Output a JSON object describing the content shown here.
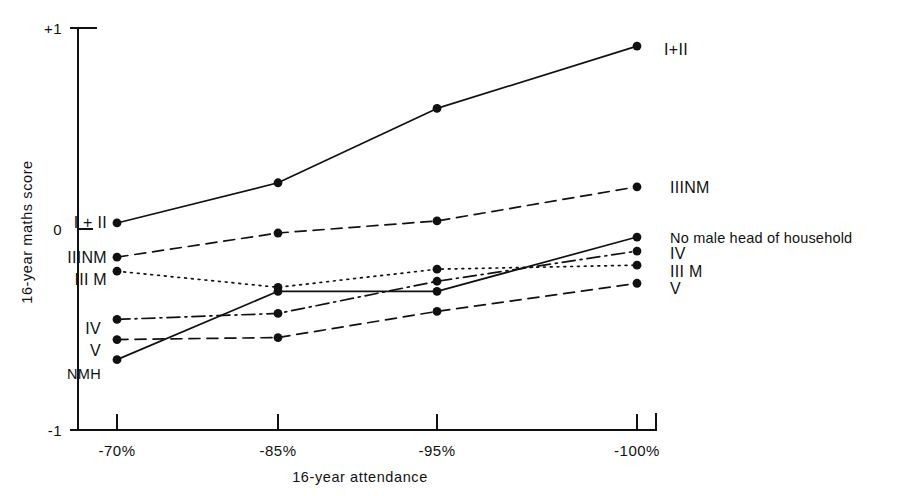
{
  "chart_data": {
    "type": "line",
    "title": "",
    "xlabel": "16-year attendance",
    "ylabel": "16-year maths score",
    "categories": [
      "-70%",
      "-85%",
      "-95%",
      "-100%"
    ],
    "xticklabels": [
      "-70%",
      "-85%",
      "-95%",
      "-100%"
    ],
    "yticklabels": [
      "+1",
      "0",
      "-1"
    ],
    "ytickvalues": [
      1,
      0,
      -1
    ],
    "ylim": [
      -1,
      1
    ],
    "grid": false,
    "legend": "inline-endpoint-labels",
    "series": [
      {
        "name": "I + II",
        "left_label": "I + II",
        "right_label": "I+II",
        "linestyle": "solid",
        "values": [
          0.03,
          0.23,
          0.6,
          0.91
        ]
      },
      {
        "name": "III NM",
        "left_label": "IIINM",
        "right_label": "IIINM",
        "linestyle": "dashed",
        "values": [
          -0.14,
          -0.02,
          0.04,
          0.21
        ]
      },
      {
        "name": "III M",
        "left_label": "III M",
        "right_label": "III M",
        "linestyle": "dotted",
        "values": [
          -0.21,
          -0.29,
          -0.2,
          -0.18
        ]
      },
      {
        "name": "IV",
        "left_label": "IV",
        "right_label": "IV",
        "linestyle": "dashdot",
        "values": [
          -0.45,
          -0.42,
          -0.26,
          -0.11
        ]
      },
      {
        "name": "V",
        "left_label": "V",
        "right_label": "V",
        "linestyle": "dashed",
        "values": [
          -0.55,
          -0.54,
          -0.41,
          -0.27
        ]
      },
      {
        "name": "No male head of household",
        "left_label": "NMH",
        "right_label": "No male head of household",
        "linestyle": "solid",
        "values": [
          -0.65,
          -0.31,
          -0.31,
          -0.04
        ]
      }
    ],
    "colors": {
      "ink": "#111111",
      "background": "#ffffff"
    }
  }
}
